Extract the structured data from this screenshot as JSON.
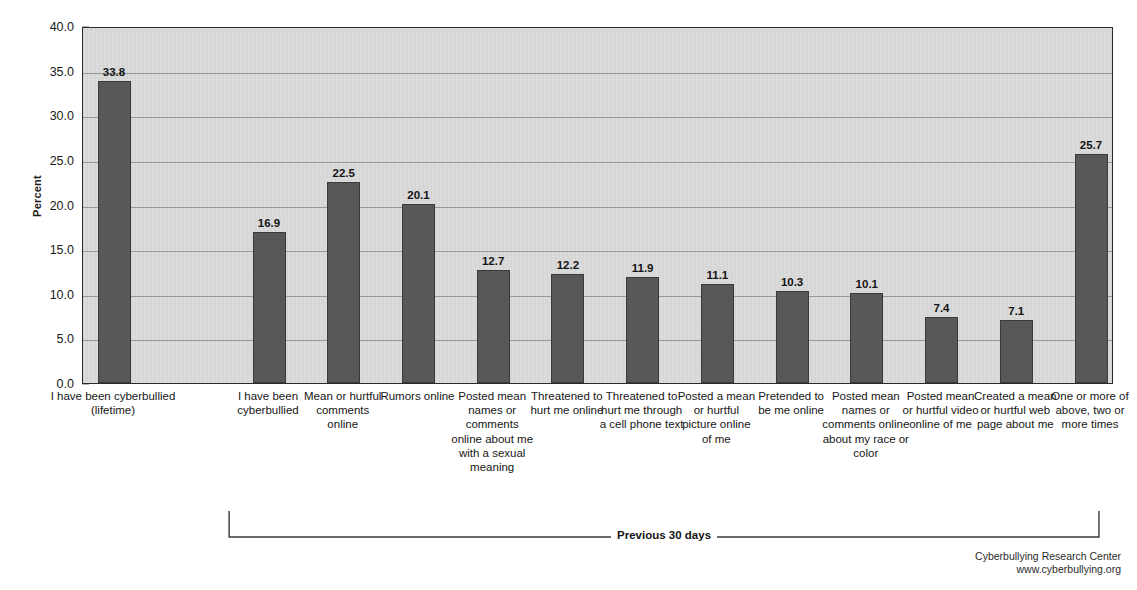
{
  "chart_data": {
    "type": "bar",
    "title": "",
    "xlabel": "",
    "ylabel": "Percent",
    "ylim": [
      0,
      40
    ],
    "ytick_step": 5,
    "grid": true,
    "legend": null,
    "categories": [
      "I have been cyberbullied (lifetime)",
      "I have been cyberbullied",
      "Mean or hurtful comments online",
      "Rumors online",
      "Posted mean names or comments online about me with a sexual meaning",
      "Threatened to hurt me online",
      "Threatened to hurt me through a cell phone text",
      "Posted a mean or hurtful picture online of me",
      "Pretended to be me online",
      "Posted mean names or comments online about my race or color",
      "Posted mean or hurtful video online of me",
      "Created a mean or hurtful web page about me",
      "One or more of above, two or more times"
    ],
    "values": [
      33.8,
      16.9,
      22.5,
      20.1,
      12.7,
      12.2,
      11.9,
      11.1,
      10.3,
      10.1,
      7.4,
      7.1,
      25.7
    ],
    "value_labels": [
      "33.8",
      "16.9",
      "22.5",
      "20.1",
      "12.7",
      "12.2",
      "11.9",
      "11.1",
      "10.3",
      "10.1",
      "7.4",
      "7.1",
      "25.7"
    ],
    "ytick_labels": [
      "0.0",
      "5.0",
      "10.0",
      "15.0",
      "20.0",
      "25.0",
      "30.0",
      "35.0",
      "40.0"
    ],
    "annotations": [
      {
        "text": "Previous 30 days",
        "spans_categories": [
          1,
          12
        ],
        "position": "below-axis"
      }
    ],
    "colors": {
      "bar": "#585858",
      "bar_edge": "#3a3a3a",
      "plot_background": "#d9d9d9",
      "gridline": "#8c8c8c",
      "axis": "#2b2b2b",
      "text": "#161616"
    }
  },
  "credit": {
    "organization": "Cyberbullying Research Center",
    "website": "www.cyberbullying.org"
  }
}
